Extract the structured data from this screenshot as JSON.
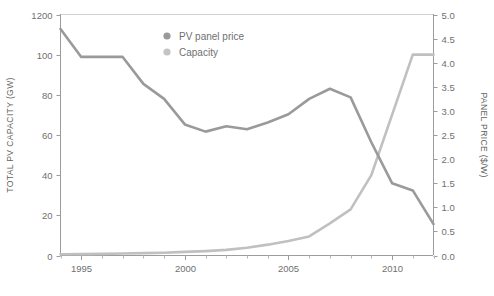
{
  "chart_data": {
    "type": "line",
    "title": "",
    "xlabel": "",
    "grid": false,
    "legend_position": "top-center",
    "x": [
      1994,
      1995,
      1996,
      1997,
      1998,
      1999,
      2000,
      2001,
      2002,
      2003,
      2004,
      2005,
      2006,
      2007,
      2008,
      2009,
      2010,
      2011,
      2012
    ],
    "xlim": [
      1994,
      2012
    ],
    "xticks": [
      1995,
      2000,
      2005,
      2010
    ],
    "xtick_labels": [
      "1995",
      "2000",
      "2005",
      "2010"
    ],
    "xminor_ticks": [
      1994,
      1995,
      1996,
      1997,
      1998,
      1999,
      2000,
      2001,
      2002,
      2003,
      2004,
      2005,
      2006,
      2007,
      2008,
      2009,
      2010,
      2011,
      2012
    ],
    "axes": [
      {
        "id": "left",
        "label": "TOTAL PV CAPACITY (GW)",
        "ylim": [
          0,
          120
        ],
        "yticks": [
          0,
          20,
          40,
          60,
          80,
          100,
          120
        ],
        "ytick_labels": [
          "0",
          "20",
          "40",
          "60",
          "80",
          "100",
          "1200"
        ]
      },
      {
        "id": "right",
        "label": "PANEL PRICE ($/W)",
        "ylim": [
          0,
          5
        ],
        "yticks": [
          0,
          0.5,
          1.0,
          1.5,
          2.0,
          2.5,
          3.0,
          3.5,
          4.0,
          4.5,
          5.0
        ],
        "ytick_labels": [
          "0.0",
          "0.5",
          "1.0",
          "1.5",
          "2.0",
          "2.5",
          "3.0",
          "3.5",
          "4.0",
          "4.5",
          "5.0"
        ]
      }
    ],
    "series": [
      {
        "name": "PV panel price",
        "axis": "right",
        "unit": "$/W",
        "color": "#9a9a9a",
        "values": [
          4.7,
          4.12,
          4.12,
          4.12,
          3.56,
          3.25,
          2.72,
          2.57,
          2.68,
          2.62,
          2.76,
          2.93,
          3.25,
          3.46,
          3.28,
          2.35,
          1.5,
          1.35,
          0.65
        ]
      },
      {
        "name": "Capacity",
        "axis": "left",
        "unit": "GW",
        "color": "#c0c0c0",
        "values": [
          0.6,
          0.7,
          0.8,
          1.0,
          1.2,
          1.4,
          1.8,
          2.2,
          2.8,
          3.9,
          5.4,
          7.2,
          9.5,
          16.0,
          23.0,
          40.0,
          70.0,
          100.0,
          100.0
        ]
      }
    ],
    "annotations": []
  },
  "legend": {
    "items": [
      {
        "label": "PV panel price",
        "color": "#9a9a9a"
      },
      {
        "label": "Capacity",
        "color": "#c4c4c4"
      }
    ]
  },
  "colors": {
    "price_line": "#9a9a9a",
    "capacity_line": "#c0c0c0",
    "axis": "#9c9c9c",
    "frame": "#cfcfcf",
    "text": "#6f6f6f",
    "background": "#ffffff"
  }
}
